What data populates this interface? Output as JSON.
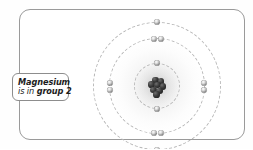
{
  "figure": {
    "element_name": "Magnesium",
    "frame": {
      "border_color": "#9a9a9a",
      "background": "#ffffff"
    }
  },
  "callout": {
    "line1": "Magnesium",
    "line2_prefix": "is in ",
    "line2_strong": "group 2",
    "border_color": "#8d8d8d"
  },
  "atom": {
    "nucleus_label": "nucleus",
    "shells": [
      {
        "name": "shell-1",
        "radius": 23,
        "electron_count": 2
      },
      {
        "name": "shell-2",
        "radius": 48,
        "electron_count": 8
      },
      {
        "name": "shell-3",
        "radius": 64,
        "electron_count": 2
      }
    ],
    "nucleons": [
      {
        "x": -1.5,
        "y": -6.0
      },
      {
        "x": 4.0,
        "y": -4.5
      },
      {
        "x": -5.5,
        "y": -1.5
      },
      {
        "x": 0.5,
        "y": -0.8
      },
      {
        "x": 6.0,
        "y": 0.5
      },
      {
        "x": -3.5,
        "y": 4.0
      },
      {
        "x": 2.5,
        "y": 4.8
      },
      {
        "x": -0.5,
        "y": 8.5
      }
    ],
    "electrons": [
      {
        "shell": 1,
        "x": 0,
        "y": -23,
        "name": "electron-inner-top"
      },
      {
        "shell": 1,
        "x": 0,
        "y": 23,
        "name": "electron-inner-bottom"
      },
      {
        "shell": 2,
        "x": -3.5,
        "y": -47,
        "name": "electron-middle-top-left"
      },
      {
        "shell": 2,
        "x": 3.5,
        "y": -47,
        "name": "electron-middle-top-right"
      },
      {
        "shell": 2,
        "x": -47,
        "y": -3.5,
        "name": "electron-middle-left-upper"
      },
      {
        "shell": 2,
        "x": -47,
        "y": 3.5,
        "name": "electron-middle-left-lower"
      },
      {
        "shell": 2,
        "x": 47,
        "y": -3.5,
        "name": "electron-middle-right-upper"
      },
      {
        "shell": 2,
        "x": 47,
        "y": 3.5,
        "name": "electron-middle-right-lower"
      },
      {
        "shell": 2,
        "x": -3.5,
        "y": 47,
        "name": "electron-middle-bottom-left"
      },
      {
        "shell": 2,
        "x": 3.5,
        "y": 47,
        "name": "electron-middle-bottom-right"
      },
      {
        "shell": 3,
        "x": 0,
        "y": -64,
        "name": "electron-outer-top"
      },
      {
        "shell": 3,
        "x": 0,
        "y": 64,
        "name": "electron-outer-bottom"
      }
    ]
  }
}
